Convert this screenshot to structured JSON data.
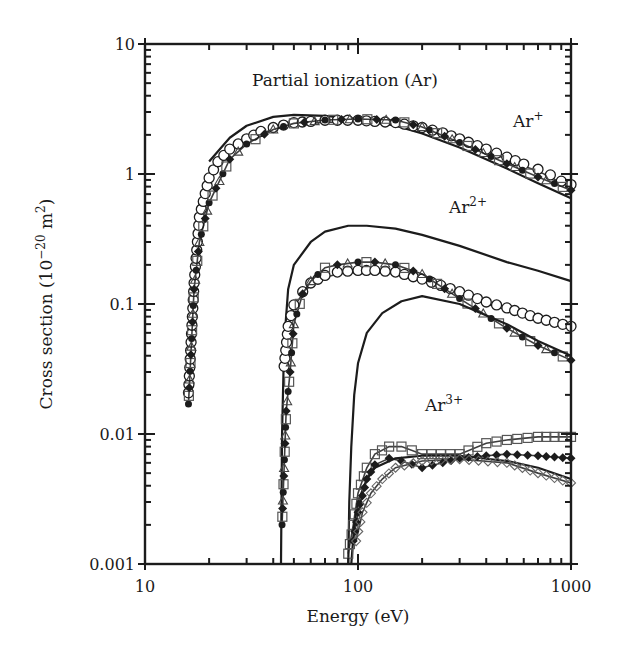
{
  "chart_data": {
    "type": "line",
    "title": "Partial ionization (Ar)",
    "xlabel": "Energy (eV)",
    "ylabel": "Cross section (10⁻²⁰ m²)",
    "ylabel_parts": {
      "main": "Cross section (10",
      "exp": "−20",
      "unit": " m",
      "unit_exp": "2",
      "close": ")"
    },
    "xscale": "log",
    "yscale": "log",
    "xlim": [
      10,
      1000
    ],
    "ylim": [
      0.001,
      10
    ],
    "x_ticks": [
      "10",
      "100",
      "1000"
    ],
    "y_ticks": [
      "0.001",
      "0.01",
      "0.1",
      "1",
      "10"
    ],
    "grid": false,
    "legend": "none",
    "annotations": [
      {
        "text": "Ar",
        "sup": "+",
        "x_eV": 700,
        "y": 2.3
      },
      {
        "text": "Ar",
        "sup": "2+",
        "x_eV": 350,
        "y": 0.5
      },
      {
        "text": "Ar",
        "sup": "3+",
        "x_eV": 270,
        "y": 0.015
      }
    ],
    "series": [
      {
        "name": "Ar+ theory",
        "style": "solid-line",
        "x": [
          20,
          25,
          30,
          40,
          50,
          70,
          100,
          150,
          200,
          300,
          500,
          700,
          1000
        ],
        "y": [
          1.25,
          1.9,
          2.35,
          2.75,
          2.85,
          2.8,
          2.65,
          2.35,
          2.05,
          1.6,
          1.1,
          0.85,
          0.65
        ]
      },
      {
        "name": "Ar+ experiment (open circles)",
        "style": "open-circle",
        "x": [
          16,
          17,
          18,
          20,
          22,
          25,
          30,
          35,
          40,
          50,
          60,
          70,
          80,
          100,
          120,
          150,
          200,
          250,
          300,
          400,
          500,
          600,
          700,
          800,
          900,
          1000
        ],
        "y": [
          0.02,
          0.14,
          0.45,
          0.9,
          1.2,
          1.5,
          1.8,
          2.05,
          2.2,
          2.4,
          2.45,
          2.5,
          2.5,
          2.5,
          2.45,
          2.4,
          2.2,
          2.0,
          1.8,
          1.5,
          1.3,
          1.15,
          1.05,
          0.95,
          0.85,
          0.8
        ]
      },
      {
        "name": "Ar+ experiment (filled/squares)",
        "style": "mixed-markers",
        "x": [
          16,
          17,
          18,
          20,
          25,
          30,
          40,
          50,
          70,
          100,
          150,
          200,
          300,
          500,
          700,
          1000
        ],
        "y": [
          0.017,
          0.13,
          0.3,
          0.6,
          1.3,
          1.7,
          2.2,
          2.45,
          2.6,
          2.65,
          2.6,
          2.3,
          1.75,
          1.2,
          0.95,
          0.75
        ]
      },
      {
        "name": "Ar2+ theory",
        "style": "solid-line",
        "x": [
          43.5,
          44,
          45,
          47,
          50,
          60,
          70,
          90,
          110,
          150,
          200,
          300,
          500,
          700,
          1000
        ],
        "y": [
          0.001,
          0.01,
          0.05,
          0.13,
          0.2,
          0.3,
          0.36,
          0.4,
          0.4,
          0.38,
          0.34,
          0.28,
          0.21,
          0.18,
          0.15
        ]
      },
      {
        "name": "Ar2+ experiment (open circles)",
        "style": "open-circle",
        "x": [
          45,
          47,
          50,
          55,
          60,
          70,
          80,
          100,
          120,
          150,
          200,
          300,
          400,
          500,
          700,
          1000
        ],
        "y": [
          0.032,
          0.065,
          0.095,
          0.12,
          0.14,
          0.16,
          0.17,
          0.175,
          0.175,
          0.17,
          0.15,
          0.12,
          0.1,
          0.09,
          0.075,
          0.065
        ]
      },
      {
        "name": "Ar2+ experiment (filled/squares)",
        "style": "mixed-markers",
        "x": [
          44,
          46,
          48,
          50,
          55,
          60,
          70,
          80,
          100,
          120,
          150,
          200,
          300,
          500,
          700,
          1000
        ],
        "y": [
          0.002,
          0.015,
          0.03,
          0.07,
          0.12,
          0.15,
          0.19,
          0.2,
          0.21,
          0.21,
          0.2,
          0.17,
          0.11,
          0.065,
          0.048,
          0.037
        ]
      },
      {
        "name": "Ar3+ theory",
        "style": "solid-line",
        "x": [
          90,
          91,
          93,
          96,
          100,
          110,
          130,
          160,
          200,
          300,
          500,
          700,
          1000
        ],
        "y": [
          0.001,
          0.003,
          0.008,
          0.02,
          0.035,
          0.06,
          0.085,
          0.105,
          0.115,
          0.1,
          0.07,
          0.052,
          0.04
        ]
      },
      {
        "name": "Ar3+ theory (low)",
        "style": "solid-line",
        "x": [
          93,
          96,
          100,
          110,
          120,
          150,
          200,
          300,
          500,
          700,
          1000
        ],
        "y": [
          0.001,
          0.002,
          0.003,
          0.0045,
          0.0055,
          0.0065,
          0.0068,
          0.0068,
          0.0062,
          0.0055,
          0.0045
        ]
      },
      {
        "name": "Ar3+ experiment (open squares)",
        "style": "open-square",
        "x": [
          90,
          95,
          100,
          110,
          120,
          140,
          160,
          200,
          300,
          400,
          500,
          700,
          1000
        ],
        "y": [
          0.0012,
          0.002,
          0.0035,
          0.0055,
          0.007,
          0.008,
          0.008,
          0.007,
          0.007,
          0.0085,
          0.009,
          0.0095,
          0.0095
        ]
      },
      {
        "name": "Ar3+ experiment (filled diamonds)",
        "style": "filled-diamond",
        "x": [
          95,
          100,
          110,
          120,
          140,
          160,
          200,
          250,
          300,
          400,
          500,
          700,
          1000
        ],
        "y": [
          0.0015,
          0.0025,
          0.0045,
          0.0058,
          0.0065,
          0.0062,
          0.0055,
          0.006,
          0.0065,
          0.0068,
          0.007,
          0.0068,
          0.0065
        ]
      },
      {
        "name": "Ar3+ experiment (open diamonds)",
        "style": "open-diamond",
        "x": [
          98,
          105,
          115,
          130,
          150,
          200,
          300,
          500,
          700,
          1000
        ],
        "y": [
          0.0015,
          0.0025,
          0.0035,
          0.0045,
          0.0055,
          0.0062,
          0.0064,
          0.006,
          0.005,
          0.0042
        ]
      }
    ]
  }
}
